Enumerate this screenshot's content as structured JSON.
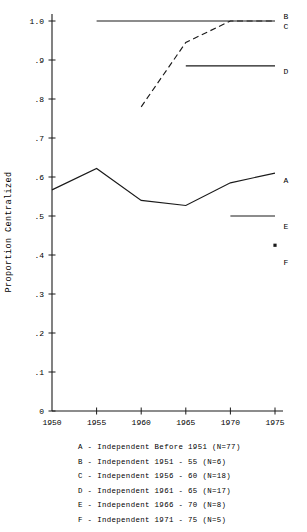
{
  "chart_data": {
    "type": "line",
    "title": "",
    "xlabel": "",
    "ylabel": "Proportion Centralized",
    "x": [
      1950,
      1955,
      1960,
      1965,
      1970,
      1975
    ],
    "xtick_labels": [
      "1950",
      "1955",
      "1960",
      "1965",
      "1970",
      "1975"
    ],
    "xlim": [
      1950,
      1975
    ],
    "ylim": [
      0,
      1.0
    ],
    "ytick_labels": [
      "0",
      ".1",
      ".2",
      ".3",
      ".4",
      ".5",
      ".6",
      ".7",
      ".8",
      ".9",
      "1.0"
    ],
    "ytick_values": [
      0,
      0.1,
      0.2,
      0.3,
      0.4,
      0.5,
      0.6,
      0.7,
      0.8,
      0.9,
      1.0
    ],
    "grid": false,
    "legend_position": "right-inline",
    "series": [
      {
        "name": "A",
        "label": "A",
        "style": "solid",
        "x": [
          1950,
          1955,
          1960,
          1965,
          1970,
          1975
        ],
        "values": [
          0.567,
          0.622,
          0.54,
          0.527,
          0.585,
          0.61
        ]
      },
      {
        "name": "B",
        "label": "B",
        "style": "solid",
        "x": [
          1955,
          1960,
          1965,
          1970,
          1975
        ],
        "values": [
          1.0,
          1.0,
          1.0,
          1.0,
          1.0
        ]
      },
      {
        "name": "C",
        "label": "C",
        "style": "dashed",
        "x": [
          1960,
          1965,
          1970,
          1975
        ],
        "values": [
          0.78,
          0.945,
          1.0,
          1.0
        ]
      },
      {
        "name": "D",
        "label": "D",
        "style": "solid",
        "x": [
          1965,
          1970,
          1975
        ],
        "values": [
          0.885,
          0.885,
          0.885
        ]
      },
      {
        "name": "E",
        "label": "E",
        "style": "solid",
        "x": [
          1970,
          1975
        ],
        "values": [
          0.5,
          0.5
        ]
      },
      {
        "name": "F",
        "label": "F",
        "style": "point",
        "x": [
          1975
        ],
        "values": [
          0.425
        ]
      }
    ]
  },
  "legend": {
    "entries": [
      "A - Independent Before 1951 (N=77)",
      "B - Independent 1951 - 55 (N=6)",
      "C - Independent 1956 - 60 (N=18)",
      "D - Independent 1961 - 65 (N=17)",
      "E - Independent 1966 - 70 (N=8)",
      "F - Independent 1971 - 75 (N=5)"
    ]
  }
}
